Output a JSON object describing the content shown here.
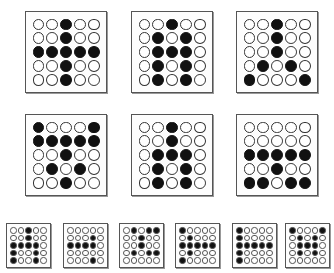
{
  "figure": {
    "colors": {
      "filled": "#111111",
      "empty": "#ffffff",
      "border": "#555555"
    },
    "large_grids": [
      {
        "id": "g1",
        "x": 25,
        "y": 11,
        "rows": [
          "00100",
          "00100",
          "11111",
          "00100",
          "00100"
        ]
      },
      {
        "id": "g2",
        "x": 131,
        "y": 11,
        "rows": [
          "00100",
          "01010",
          "01110",
          "01010",
          "01010"
        ]
      },
      {
        "id": "g3",
        "x": 236,
        "y": 11,
        "rows": [
          "00100",
          "00100",
          "00100",
          "01010",
          "10001"
        ]
      },
      {
        "id": "g4",
        "x": 25,
        "y": 114,
        "rows": [
          "10001",
          "11111",
          "00100",
          "01010",
          "00100"
        ]
      },
      {
        "id": "g5",
        "x": 131,
        "y": 114,
        "rows": [
          "00100",
          "00100",
          "01110",
          "01010",
          "01010"
        ]
      },
      {
        "id": "g6",
        "x": 236,
        "y": 114,
        "rows": [
          "00000",
          "00000",
          "11111",
          "00100",
          "11011"
        ]
      }
    ],
    "small_grids": [
      {
        "id": "s1",
        "x": 6,
        "y": 223,
        "rows": [
          "00100",
          "00100",
          "11110",
          "10010",
          "10010"
        ]
      },
      {
        "id": "s2",
        "x": 63,
        "y": 223,
        "rows": [
          "00000",
          "00010",
          "11110",
          "00000",
          "00010"
        ]
      },
      {
        "id": "s3",
        "x": 119,
        "y": 223,
        "rows": [
          "01011",
          "00100",
          "00100",
          "01011",
          "00000"
        ]
      },
      {
        "id": "s4",
        "x": 175,
        "y": 223,
        "rows": [
          "10000",
          "01000",
          "11111",
          "01000",
          "10000"
        ]
      },
      {
        "id": "s5",
        "x": 232,
        "y": 223,
        "rows": [
          "10000",
          "10000",
          "11111",
          "10000",
          "10000"
        ]
      },
      {
        "id": "s6",
        "x": 285,
        "y": 223,
        "rows": [
          "10001",
          "01010",
          "01110",
          "01010",
          "00000"
        ]
      }
    ]
  }
}
